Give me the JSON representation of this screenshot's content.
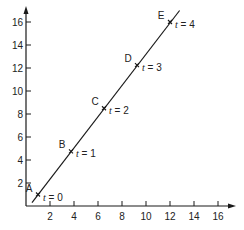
{
  "chart_data": {
    "type": "line",
    "title": "",
    "xlabel": "",
    "ylabel": "",
    "xlim": [
      0,
      17
    ],
    "ylim": [
      0,
      17
    ],
    "grid": false,
    "legend": null,
    "x_ticks": [
      2,
      4,
      6,
      8,
      10,
      12,
      14,
      16
    ],
    "y_ticks": [
      2,
      4,
      6,
      8,
      10,
      12,
      14,
      16
    ],
    "series": [
      {
        "name": "parametric line",
        "points": [
          {
            "label": "A",
            "t_label": "t = 0",
            "t": 0,
            "x": 1.0,
            "y": 1.0
          },
          {
            "label": "B",
            "t_label": "t = 1",
            "t": 1,
            "x": 3.75,
            "y": 4.75
          },
          {
            "label": "C",
            "t_label": "t = 2",
            "t": 2,
            "x": 6.5,
            "y": 8.5
          },
          {
            "label": "D",
            "t_label": "t = 3",
            "t": 3,
            "x": 9.25,
            "y": 12.25
          },
          {
            "label": "E",
            "t_label": "t = 4",
            "t": 4,
            "x": 12.0,
            "y": 16.0
          }
        ],
        "line_extent": {
          "x_start": 0.5,
          "y_start": 0.3,
          "x_end": 12.8,
          "y_end": 17.0
        }
      }
    ],
    "colors": {
      "line": "#1a1a1a",
      "axis": "#1a1a1a",
      "text": "#222222"
    }
  }
}
